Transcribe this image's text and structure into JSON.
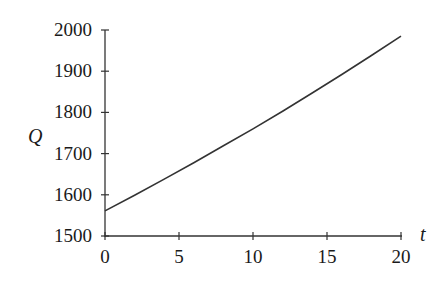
{
  "chart_data": {
    "type": "line",
    "title": "",
    "xlabel": "t",
    "ylabel": "Q",
    "xlim": [
      0,
      20
    ],
    "ylim": [
      1500,
      2000
    ],
    "xticks": [
      0,
      5,
      10,
      15,
      20
    ],
    "yticks": [
      1500,
      1600,
      1700,
      1800,
      1900,
      2000
    ],
    "grid": false,
    "legend": null,
    "series": [
      {
        "name": "Q(t)",
        "x": [
          0,
          2,
          4,
          6,
          8,
          10,
          12,
          14,
          16,
          18,
          20
        ],
        "values": [
          1561,
          1599,
          1638,
          1678,
          1719,
          1760,
          1803,
          1847,
          1892,
          1938,
          1985
        ]
      }
    ]
  },
  "labels": {
    "x_axis": "t",
    "y_axis": "Q",
    "xticks": [
      "0",
      "5",
      "10",
      "15",
      "20"
    ],
    "yticks": [
      "1500",
      "1600",
      "1700",
      "1800",
      "1900",
      "2000"
    ]
  }
}
